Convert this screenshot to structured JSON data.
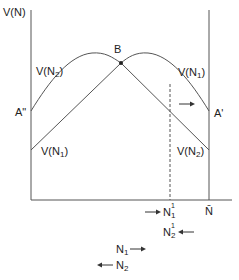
{
  "diagram": {
    "y_axis_label": "V(N)",
    "x_axis_end_label": "N̄",
    "point_b_label": "B",
    "left_intercept_label": "A\"",
    "right_intercept_label": "A'",
    "curves": [
      {
        "name": "V(N2)",
        "label_main": "V(N",
        "label_sub": "2",
        "label_close": ")",
        "position": "upper-left"
      },
      {
        "name": "V(N1)",
        "label_main": "V(N",
        "label_sub": "1",
        "label_close": ")",
        "position": "upper-right"
      },
      {
        "name": "V(N1)",
        "label_main": "V(N",
        "label_sub": "1",
        "label_close": ")",
        "position": "lower-left"
      },
      {
        "name": "V(N2)",
        "label_main": "V(N",
        "label_sub": "2",
        "label_close": ")",
        "position": "lower-right"
      }
    ],
    "axis_annotations": [
      {
        "main": "N",
        "sub": "1",
        "sup": "1",
        "arrow": "right",
        "arrow_side": "left"
      },
      {
        "main": "N",
        "sub": "2",
        "sup": "1",
        "arrow": "left",
        "arrow_side": "right"
      },
      {
        "main": "N",
        "sub": "1",
        "arrow": "right",
        "arrow_side": "right"
      },
      {
        "main": "N",
        "sub": "2",
        "arrow": "left",
        "arrow_side": "left"
      }
    ],
    "colors": {
      "line": "#555555",
      "text": "#222222"
    }
  }
}
